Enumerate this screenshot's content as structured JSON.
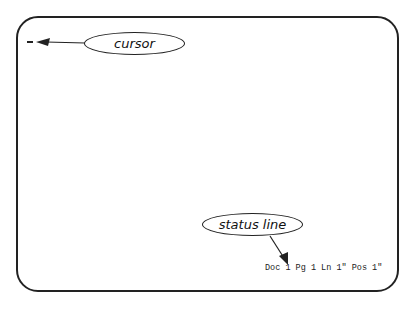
{
  "callouts": {
    "cursor_label": "cursor",
    "status_line_label": "status line"
  },
  "status_line": {
    "text": "Doc 1 Pg 1 Ln 1\" Pos 1\"",
    "doc": "1",
    "page": "1",
    "line": "1\"",
    "position": "1\""
  },
  "screen": {
    "cursor_glyph": "_"
  }
}
